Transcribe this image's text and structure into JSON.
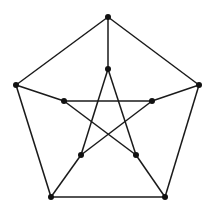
{
  "diagram": {
    "type": "graph",
    "name": "Petersen graph",
    "style": {
      "edge_color": "#1a1a1a",
      "node_color": "#111111",
      "background": "#ffffff",
      "node_radius": 3
    },
    "nodes": [
      {
        "id": "o0",
        "ring": "outer",
        "x": 108,
        "y": 17
      },
      {
        "id": "o1",
        "ring": "outer",
        "x": 199,
        "y": 85
      },
      {
        "id": "o2",
        "ring": "outer",
        "x": 165,
        "y": 197
      },
      {
        "id": "o3",
        "ring": "outer",
        "x": 51,
        "y": 197
      },
      {
        "id": "o4",
        "ring": "outer",
        "x": 16,
        "y": 85
      },
      {
        "id": "i0",
        "ring": "inner",
        "x": 108,
        "y": 69
      },
      {
        "id": "i1",
        "ring": "inner",
        "x": 152,
        "y": 101
      },
      {
        "id": "i2",
        "ring": "inner",
        "x": 136,
        "y": 155
      },
      {
        "id": "i3",
        "ring": "inner",
        "x": 81,
        "y": 155
      },
      {
        "id": "i4",
        "ring": "inner",
        "x": 64,
        "y": 101
      }
    ],
    "edges": [
      [
        "o0",
        "o1"
      ],
      [
        "o1",
        "o2"
      ],
      [
        "o2",
        "o3"
      ],
      [
        "o3",
        "o4"
      ],
      [
        "o4",
        "o0"
      ],
      [
        "o0",
        "i0"
      ],
      [
        "o1",
        "i1"
      ],
      [
        "o2",
        "i2"
      ],
      [
        "o3",
        "i3"
      ],
      [
        "o4",
        "i4"
      ],
      [
        "i0",
        "i2"
      ],
      [
        "i2",
        "i4"
      ],
      [
        "i4",
        "i1"
      ],
      [
        "i1",
        "i3"
      ],
      [
        "i3",
        "i0"
      ]
    ]
  }
}
